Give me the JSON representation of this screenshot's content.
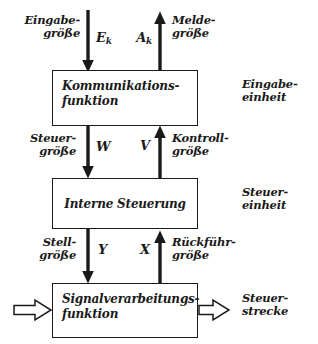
{
  "diagram": {
    "background_color": "#ffffff",
    "stroke_color": "#1a1a1a",
    "blocks": [
      {
        "id": "kommunikation",
        "text": "Kommunikations-\nfunktion",
        "unit_label": "Eingabe-\neinheit"
      },
      {
        "id": "interne_steuerung",
        "text": "Interne  Steuerung",
        "unit_label": "Steuer-\neinheit"
      },
      {
        "id": "signalverarbeitung",
        "text": "Signalverarbeitungs-\nfunktion",
        "unit_label": "Steuer-\nstrecke"
      }
    ],
    "signals": [
      {
        "id": "eingabegroesse",
        "label": "Eingabe-\ngröße",
        "symbol": "E",
        "subscript": "k",
        "direction": "down"
      },
      {
        "id": "meldegroesse",
        "label": "Melde-\ngröße",
        "symbol": "A",
        "subscript": "k",
        "direction": "up"
      },
      {
        "id": "steuergroesse",
        "label": "Steuer-\ngröße",
        "symbol": "W",
        "subscript": "",
        "direction": "down"
      },
      {
        "id": "kontrollgroesse",
        "label": "Kontroll-\ngröße",
        "symbol": "V",
        "subscript": "",
        "direction": "up"
      },
      {
        "id": "stellgroesse",
        "label": "Stell-\ngröße",
        "symbol": "Y",
        "subscript": "",
        "direction": "down"
      },
      {
        "id": "rueckfuehrgroesse",
        "label": "Rückführ-\ngröße",
        "symbol": "X",
        "subscript": "",
        "direction": "up"
      }
    ],
    "process_flow": {
      "inlet_icon": "open-arrow-right-icon",
      "outlet_icon": "open-arrow-right-icon"
    }
  }
}
